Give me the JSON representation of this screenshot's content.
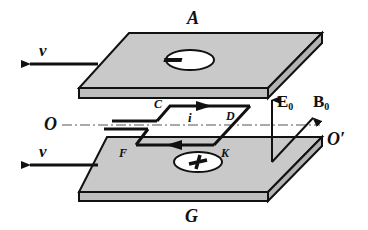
{
  "figure": {
    "type": "physics-diagram"
  },
  "plates": {
    "top": {
      "label": "A",
      "charge_symbol": "−",
      "color": "#c8c8c8"
    },
    "bottom": {
      "label": "G",
      "charge_symbol": "+",
      "color": "#c8c8c8"
    }
  },
  "velocity": {
    "label": "v",
    "direction": "left"
  },
  "axis": {
    "start_label": "O",
    "end_label": "O′"
  },
  "loop": {
    "corners": [
      "C",
      "D",
      "K",
      "F"
    ],
    "current_label": "i"
  },
  "fields": {
    "electric": {
      "label": "E",
      "subscript": "0"
    },
    "magnetic": {
      "label": "B",
      "subscript": "0"
    }
  }
}
